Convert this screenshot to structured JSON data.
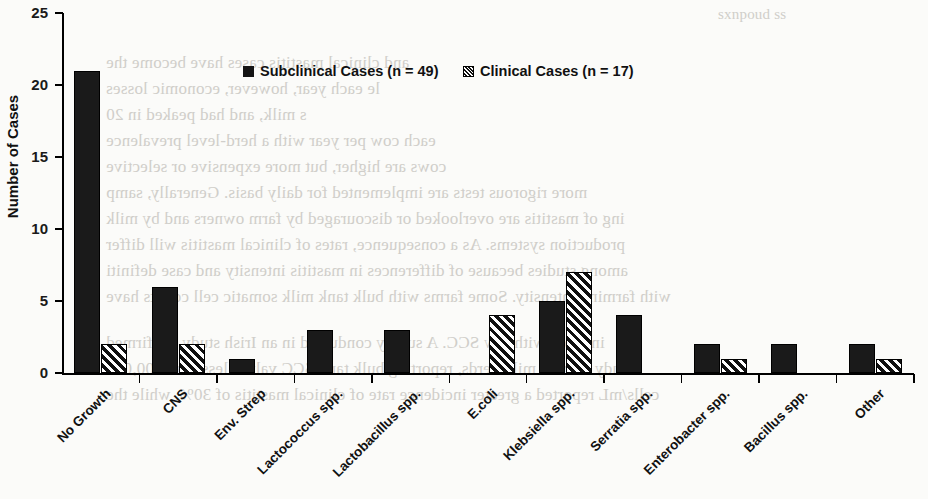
{
  "chart_data": {
    "type": "bar",
    "title": "",
    "xlabel": "",
    "ylabel": "Number of Cases",
    "ylim": [
      0,
      25
    ],
    "yticks": [
      0,
      5,
      10,
      15,
      20,
      25
    ],
    "grid": false,
    "legend_position": "top-center",
    "categories": [
      "No Growth",
      "CNS",
      "Env. Strep",
      "Lactococcus spp.",
      "Lactobacillus spp.",
      "E.coli",
      "Klebsiella spp.",
      "Serratia spp.",
      "Enterobacter spp.",
      "Bacillus spp.",
      "Other"
    ],
    "series": [
      {
        "name": "Subclinical Cases (n = 49)",
        "marker": "solid-black-square",
        "values": [
          21,
          6,
          1,
          3,
          3,
          0,
          5,
          4,
          2,
          2,
          2
        ]
      },
      {
        "name": "Clinical Cases (n = 17)",
        "marker": "diagonal-hatched-square",
        "values": [
          2,
          2,
          0,
          0,
          0,
          4,
          7,
          0,
          1,
          0,
          1
        ]
      }
    ]
  },
  "axis": {
    "y_tick_labels": [
      "0",
      "5",
      "10",
      "15",
      "20",
      "25"
    ],
    "y_axis_title": "Number of Cases"
  },
  "legend": {
    "items": [
      {
        "label": "Subclinical Cases (n = 49)",
        "marker": "solid-black-square"
      },
      {
        "label": "Clinical Cases (n = 17)",
        "marker": "diagonal-hatched-square"
      }
    ]
  },
  "colors": {
    "subclinical": "#1a1a1a",
    "clinical_outline": "#000000",
    "clinical_fill": "#ffffff",
    "axis": "#000000",
    "page_background": "#fbfbf9"
  },
  "background_text": {
    "note": "faint mirrored show-through text from the reverse side of the scanned page",
    "lines": [
      "sxnpoud ss",
      "and clinical mastitis cases have become the",
      "le each year, however, economic losses",
      "s milk, and had peaked in 20",
      "each cow per year with a herd-level prevalence",
      "cows are higher, but more expensive or selective",
      "more rigorous tests are implemented for daily basis. Generally, samp",
      "ing of mastitis are overlooked or discouraged by farm owners and by milk",
      "production systems. As a consequence, rates of clinical mastitis will differ",
      "among studies because of differences in mastitis intensity and case definiti",
      "with farming intensity. Some farms with bulk tank milk somatic cell counts have",
      "in those with low SCC. A survey conducted in an Irish study confirmed",
      "study of bulk milk herds, reporting bulk tank SCC values less than 200,000",
      "cells/mL reported a greater incidence rate of clinical mastitis of 30%, while the"
    ]
  }
}
